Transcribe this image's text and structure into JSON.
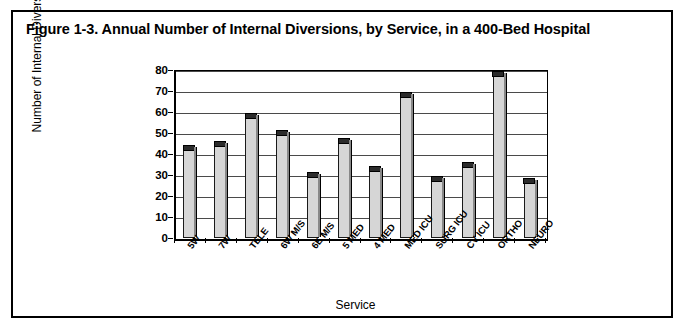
{
  "figure": {
    "title": "Figure 1-3. Annual Number of Internal Diversions, by Service, in a 400-Bed Hospital"
  },
  "chart_data": {
    "type": "bar",
    "title": "Figure 1-3. Annual Number of Internal Diversions, by Service, in a 400-Bed Hospital",
    "xlabel": "Service",
    "ylabel": "Number of Internal Diversions",
    "categories": [
      "5W",
      "7W",
      "TELE",
      "6W M/S",
      "6E M/S",
      "5 MED",
      "4 MED",
      "MED ICU",
      "SURG ICU",
      "CV ICU",
      "ORTHO",
      "NEURO"
    ],
    "values": [
      43,
      45,
      58,
      50,
      30,
      46,
      33,
      68,
      28,
      35,
      78,
      27
    ],
    "ylim": [
      0,
      80
    ],
    "yticks": [
      0,
      10,
      20,
      30,
      40,
      50,
      60,
      70,
      80
    ],
    "ytick_labels": [
      "0",
      "10",
      "20",
      "30",
      "40",
      "50",
      "60",
      "70",
      "80"
    ],
    "grid": true,
    "legend": "none",
    "bar_fill_color": "#d6d6d6",
    "bar_edge_color": "#1a1a1a"
  }
}
